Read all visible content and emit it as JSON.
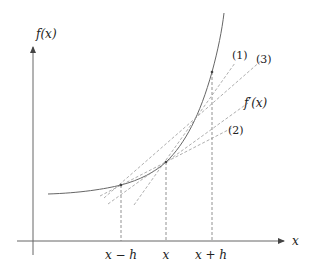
{
  "diagram": {
    "y_axis_label": "f(x)",
    "x_axis_label": "x",
    "tick_labels": {
      "minus": "x − h",
      "center": "x",
      "plus": "x + h"
    },
    "line_labels": {
      "forward": "(1)",
      "backward": "(2)",
      "central": "(3)",
      "tangent": "f′(x)"
    },
    "points": {
      "x_minus_h": [
        121,
        185
      ],
      "x": [
        166,
        162
      ],
      "x_plus_h": [
        212,
        72
      ]
    },
    "colors": {
      "axis": "#555555",
      "curve": "#555555",
      "dashed": "#999999"
    }
  }
}
